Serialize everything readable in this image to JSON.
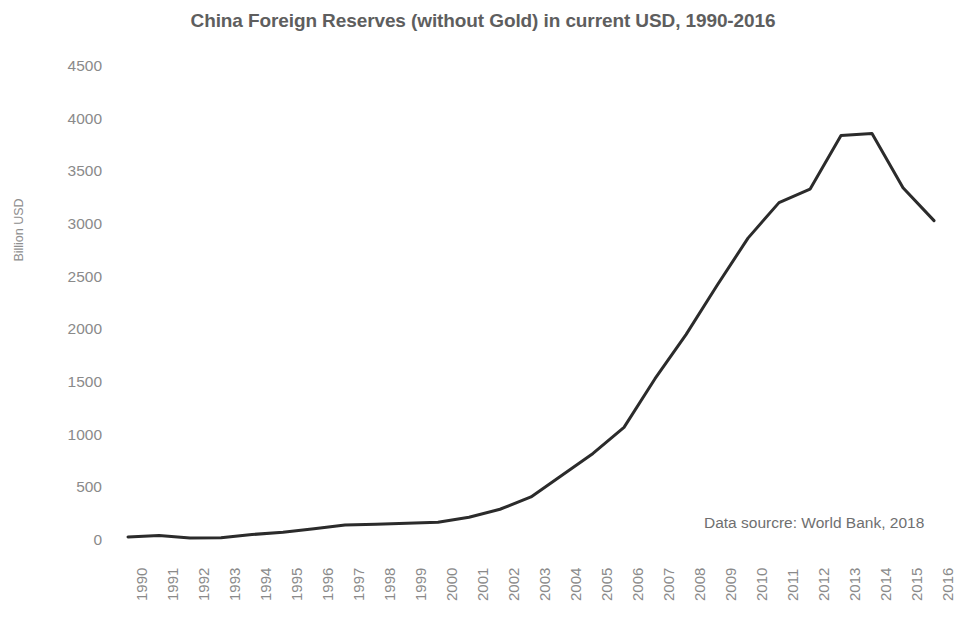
{
  "chart_data": {
    "type": "line",
    "title": "China Foreign Reserves (without Gold) in current USD, 1990-2016",
    "xlabel": "",
    "ylabel": "Billion USD",
    "categories": [
      "1990",
      "1991",
      "1992",
      "1993",
      "1994",
      "1995",
      "1996",
      "1997",
      "1998",
      "1999",
      "2000",
      "2001",
      "2002",
      "2003",
      "2004",
      "2005",
      "2006",
      "2007",
      "2008",
      "2009",
      "2010",
      "2011",
      "2012",
      "2013",
      "2014",
      "2015",
      "2016"
    ],
    "values": [
      29,
      43,
      20,
      22,
      52,
      74,
      107,
      143,
      150,
      158,
      168,
      216,
      292,
      409,
      615,
      822,
      1069,
      1531,
      1950,
      2416,
      2866,
      3203,
      3331,
      3840,
      3859,
      3345,
      3032
    ],
    "series": [
      {
        "name": "China Foreign Reserves (without Gold)",
        "values": [
          29,
          43,
          20,
          22,
          52,
          74,
          107,
          143,
          150,
          158,
          168,
          216,
          292,
          409,
          615,
          822,
          1069,
          1531,
          1950,
          2416,
          2866,
          3203,
          3331,
          3840,
          3859,
          3345,
          3032
        ]
      }
    ],
    "ylim": [
      0,
      4500
    ],
    "yticks": [
      0,
      500,
      1000,
      1500,
      2000,
      2500,
      3000,
      3500,
      4000,
      4500
    ],
    "ytick_labels": [
      "0",
      "500",
      "1000",
      "1500",
      "2000",
      "2500",
      "3000",
      "3500",
      "4000",
      "4500"
    ],
    "grid": false,
    "legend": "none",
    "line_color": "#2b2b2b",
    "line_width": 3,
    "annotations": [
      {
        "text": "Data sourcre: World Bank, 2018",
        "x": 704,
        "y": 514
      }
    ]
  },
  "style": {
    "background": "#ffffff",
    "title_color": "#5e5e5e",
    "tick_color": "#8a8a8a",
    "axis_label_color": "#8e8e8e",
    "note_color": "#6f6f6f"
  }
}
